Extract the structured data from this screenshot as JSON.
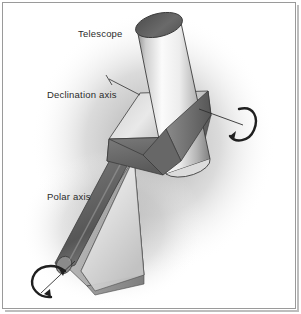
{
  "figure": {
    "title_alt": "Equatorial telescope mount diagram",
    "background_color": "#ffffff",
    "frame_color": "#9a9a9a",
    "label_color": "#2b2b2b",
    "labels": [
      {
        "id": "telescope",
        "text": "Telescope"
      },
      {
        "id": "declination",
        "text": "Declination axis"
      },
      {
        "id": "polar",
        "text": "Polar axis"
      }
    ],
    "parts": {
      "tube_name": "telescope-tube",
      "block_name": "declination-mount-block",
      "polar_rod_name": "polar-axis-rod",
      "wedge_name": "polar-wedge-base",
      "rotation_arrow_dec": "declination-rotation-arrow",
      "rotation_arrow_polar": "polar-rotation-arrow"
    },
    "colors": {
      "tube_light": "#f2f2f2",
      "tube_mid": "#c9c9c9",
      "tube_dark": "#7d7d7d",
      "tube_top_ellipse": "#5c5c5c",
      "block_light": "#d8d8d8",
      "block_dark": "#6e6e6e",
      "rod_dark": "#6b6b6b",
      "wedge_light": "#e8e8e8",
      "wedge_mid": "#b4b4b4",
      "shadow": "#b9b9b9",
      "outline": "#3a3a3a"
    }
  }
}
